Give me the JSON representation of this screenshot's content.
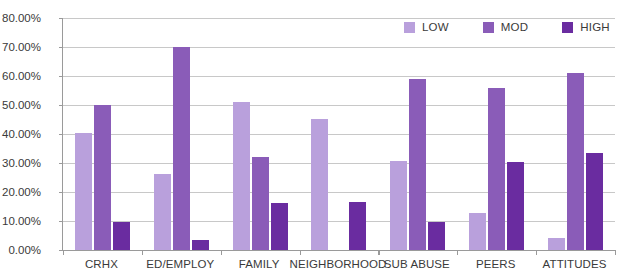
{
  "chart_data": {
    "type": "bar",
    "title": "",
    "xlabel": "",
    "ylabel": "",
    "ylim": [
      0,
      80
    ],
    "ytick_step": 10,
    "ytick_labels": [
      "0.00%",
      "10.00%",
      "20.00%",
      "30.00%",
      "40.00%",
      "50.00%",
      "60.00%",
      "70.00%",
      "80.00%"
    ],
    "ytick_values": [
      0,
      10,
      20,
      30,
      40,
      50,
      60,
      70,
      80
    ],
    "grid": true,
    "legend_position": "top-right",
    "categories": [
      "CRHX",
      "ED/EMPLOY",
      "FAMILY",
      "NEIGHBORHOOD",
      "SUB ABUSE",
      "PEERS",
      "ATTITUDES"
    ],
    "series": [
      {
        "name": "LOW",
        "color": "#b9a0dc",
        "values": [
          40.4,
          26.2,
          51.2,
          45.3,
          30.6,
          12.9,
          4.0
        ]
      },
      {
        "name": "MOD",
        "color": "#8a5cb8",
        "values": [
          50.0,
          70.0,
          32.0,
          0.0,
          58.8,
          56.0,
          61.2
        ]
      },
      {
        "name": "HIGH",
        "color": "#6a2ca0",
        "values": [
          9.8,
          3.3,
          16.2,
          16.5,
          9.8,
          30.2,
          33.6
        ]
      }
    ]
  },
  "colors": {
    "low": "#b9a0dc",
    "mod": "#8a5cb8",
    "high": "#6a2ca0",
    "axis": "#9a9a9a",
    "gridline": "#c8c8c8",
    "text": "#3a3a3a",
    "background": "#ffffff"
  }
}
